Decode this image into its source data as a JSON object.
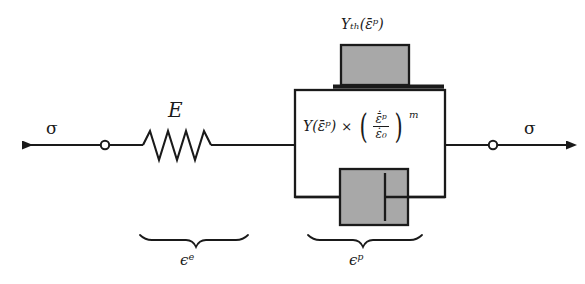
{
  "figure": {
    "kind": "rheological-model-diagram",
    "background_color": "#ffffff",
    "line_color": "#1a1a1a",
    "block_fill_color": "#a8a8a8"
  },
  "labels": {
    "stress_left": "σ",
    "stress_right": "σ",
    "modulus": "E",
    "threshold": "Yₜₕ(ε̄ᵖ)",
    "elastic_strain": "ϵᵉ",
    "plastic_strain": "ϵᵖ"
  },
  "flow_rule": {
    "yield_term": "Y(ε̄ᵖ)",
    "operator": "×",
    "open_paren": "(",
    "close_paren": ")",
    "numerator": "ε̄̇ᵖ",
    "denominator": "ε̇₀",
    "exponent": "m",
    "full_text": "Y(ε̄ᵖ) × (ε̄̇ᵖ / ε̇₀)^m"
  },
  "elements": {
    "spring": {
      "name": "elastic-spring",
      "peaks": 4
    },
    "friction_block": {
      "name": "friction-slider-block"
    },
    "dashpot": {
      "name": "viscous-dashpot"
    },
    "left_node": {
      "name": "left-connector-node"
    },
    "right_node": {
      "name": "right-connector-node"
    },
    "left_arrow": {
      "name": "stress-arrow-left",
      "direction": "left"
    },
    "right_arrow": {
      "name": "stress-arrow-right",
      "direction": "right"
    },
    "plastic_box": {
      "name": "plastic-element-box"
    },
    "elastic_brace": {
      "name": "elastic-strain-brace"
    },
    "plastic_brace": {
      "name": "plastic-strain-brace"
    }
  }
}
